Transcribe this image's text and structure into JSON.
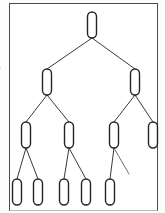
{
  "figure": {
    "type": "binary-tree-diagram",
    "background_color": "#ffffff",
    "frame": {
      "border_color": "#4a4a4a",
      "x": 9,
      "y": 3,
      "width": 149,
      "height": 208,
      "label": "figure border"
    },
    "margin_fragments": [
      {
        "text": "b",
        "top": 63
      },
      {
        "text": "a",
        "top": 122
      }
    ],
    "style": {
      "node_fill": "#ffffff",
      "node_stroke": "#242424",
      "edge_stroke": "#3a3a3a",
      "node_shape": "vertical-capsule",
      "node_label": ""
    },
    "levels": [
      {
        "index": 0,
        "name": "root",
        "node_count": 1
      },
      {
        "index": 1,
        "name": "level-2",
        "node_count": 2
      },
      {
        "index": 2,
        "name": "level-3",
        "node_count": 4
      },
      {
        "index": 3,
        "name": "leaves",
        "node_count": 5
      }
    ],
    "nodes": [
      {
        "id": "n0",
        "level": 0,
        "cx": 92,
        "cy": 25,
        "rx": 4.5,
        "ry": 13,
        "label": "",
        "name": "tree-node-root"
      },
      {
        "id": "n1",
        "level": 1,
        "cx": 47,
        "cy": 82,
        "rx": 4.5,
        "ry": 13,
        "label": "",
        "name": "tree-node-left"
      },
      {
        "id": "n2",
        "level": 1,
        "cx": 135,
        "cy": 82,
        "rx": 4.5,
        "ry": 13,
        "label": "",
        "name": "tree-node-right"
      },
      {
        "id": "n3",
        "level": 2,
        "cx": 26,
        "cy": 135,
        "rx": 4.5,
        "ry": 13,
        "label": "",
        "name": "tree-node-l-l"
      },
      {
        "id": "n4",
        "level": 2,
        "cx": 69,
        "cy": 135,
        "rx": 4.5,
        "ry": 13,
        "label": "",
        "name": "tree-node-l-r"
      },
      {
        "id": "n5",
        "level": 2,
        "cx": 114,
        "cy": 135,
        "rx": 4.5,
        "ry": 13,
        "label": "",
        "name": "tree-node-r-l"
      },
      {
        "id": "n6",
        "level": 2,
        "cx": 153,
        "cy": 135,
        "rx": 4.5,
        "ry": 13,
        "label": "",
        "name": "tree-node-r-r"
      },
      {
        "id": "n7",
        "level": 3,
        "cx": 17,
        "cy": 192,
        "rx": 4.5,
        "ry": 13,
        "label": "",
        "name": "tree-leaf-1"
      },
      {
        "id": "n8",
        "level": 3,
        "cx": 38,
        "cy": 192,
        "rx": 4.5,
        "ry": 13,
        "label": "",
        "name": "tree-leaf-2"
      },
      {
        "id": "n9",
        "level": 3,
        "cx": 64,
        "cy": 192,
        "rx": 4.5,
        "ry": 13,
        "label": "",
        "name": "tree-leaf-3"
      },
      {
        "id": "n10",
        "level": 3,
        "cx": 86,
        "cy": 192,
        "rx": 4.5,
        "ry": 13,
        "label": "",
        "name": "tree-leaf-4"
      },
      {
        "id": "n11",
        "level": 3,
        "cx": 110,
        "cy": 192,
        "rx": 4.5,
        "ry": 13,
        "label": "",
        "name": "tree-leaf-5"
      }
    ],
    "edges": [
      {
        "id": "e0",
        "from": "n0",
        "to": "n1",
        "x1": 92,
        "y1": 38,
        "x2": 47,
        "y2": 69,
        "dangling": false,
        "name": "tree-edge-root-left"
      },
      {
        "id": "e1",
        "from": "n0",
        "to": "n2",
        "x1": 92,
        "y1": 38,
        "x2": 135,
        "y2": 69,
        "dangling": false,
        "name": "tree-edge-root-right"
      },
      {
        "id": "e2",
        "from": "n1",
        "to": "n3",
        "x1": 47,
        "y1": 95,
        "x2": 26,
        "y2": 122,
        "dangling": false,
        "name": "tree-edge-left-ll"
      },
      {
        "id": "e3",
        "from": "n1",
        "to": "n4",
        "x1": 47,
        "y1": 95,
        "x2": 69,
        "y2": 122,
        "dangling": false,
        "name": "tree-edge-left-lr"
      },
      {
        "id": "e4",
        "from": "n2",
        "to": "n5",
        "x1": 135,
        "y1": 95,
        "x2": 114,
        "y2": 122,
        "dangling": false,
        "name": "tree-edge-right-rl"
      },
      {
        "id": "e5",
        "from": "n2",
        "to": "n6",
        "x1": 135,
        "y1": 95,
        "x2": 153,
        "y2": 122,
        "dangling": false,
        "name": "tree-edge-right-rr"
      },
      {
        "id": "e6",
        "from": "n3",
        "to": "n7",
        "x1": 26,
        "y1": 148,
        "x2": 17,
        "y2": 179,
        "dangling": false,
        "name": "tree-edge-ll-leaf1"
      },
      {
        "id": "e7",
        "from": "n3",
        "to": "n8",
        "x1": 26,
        "y1": 148,
        "x2": 38,
        "y2": 179,
        "dangling": false,
        "name": "tree-edge-ll-leaf2"
      },
      {
        "id": "e8",
        "from": "n4",
        "to": "n9",
        "x1": 69,
        "y1": 148,
        "x2": 64,
        "y2": 179,
        "dangling": false,
        "name": "tree-edge-lr-leaf3"
      },
      {
        "id": "e9",
        "from": "n4",
        "to": "n10",
        "x1": 69,
        "y1": 148,
        "x2": 86,
        "y2": 179,
        "dangling": false,
        "name": "tree-edge-lr-leaf4"
      },
      {
        "id": "e10",
        "from": "n5",
        "to": "n11",
        "x1": 114,
        "y1": 148,
        "x2": 110,
        "y2": 179,
        "dangling": false,
        "name": "tree-edge-rl-leaf5"
      },
      {
        "id": "e11",
        "from": "n5",
        "to": null,
        "x1": 114,
        "y1": 148,
        "x2": 129,
        "y2": 174,
        "dangling": true,
        "name": "tree-edge-rl-dangling"
      }
    ]
  }
}
